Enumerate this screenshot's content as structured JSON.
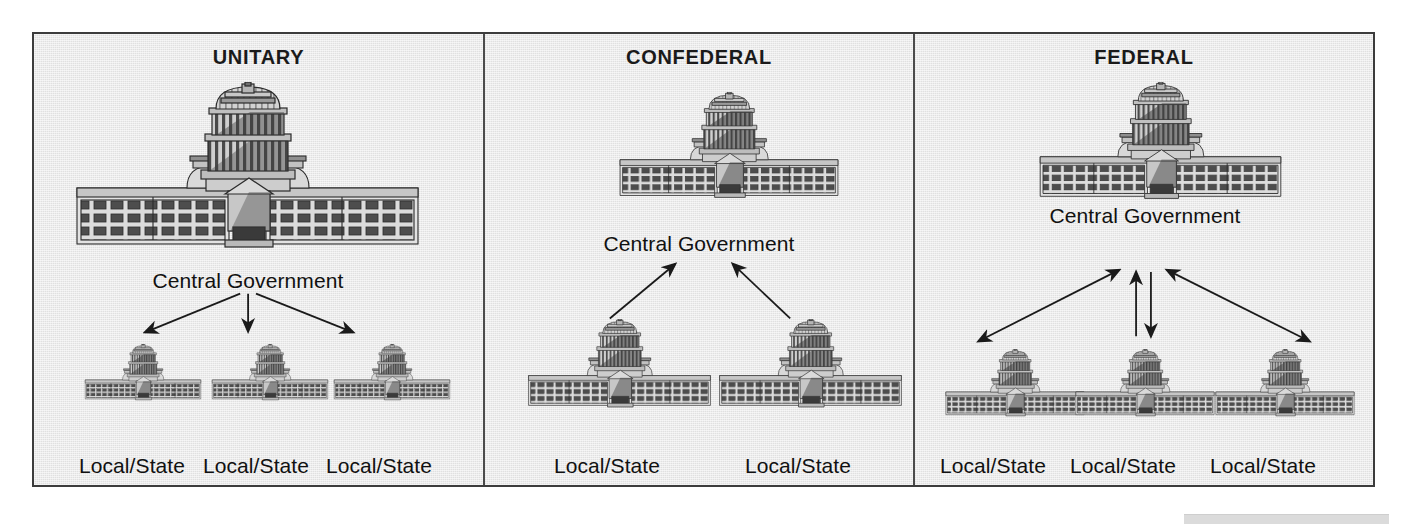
{
  "figure": {
    "background_color": "#e9e9e9",
    "frame_border_color": "#3c3c3c",
    "ink_color": "#1a1a1a"
  },
  "panels": [
    {
      "id": "unitary",
      "title": "UNITARY",
      "central_label": "Central Government",
      "flow": "top-down",
      "arrow_description": "three arrows from central government down to each local/state",
      "children": [
        {
          "label": "Local/State"
        },
        {
          "label": "Local/State"
        },
        {
          "label": "Local/State"
        }
      ]
    },
    {
      "id": "confederal",
      "title": "CONFEDERAL",
      "central_label": "Central Government",
      "flow": "bottom-up",
      "arrow_description": "two arrows from local/state up to central government",
      "children": [
        {
          "label": "Local/State"
        },
        {
          "label": "Local/State"
        }
      ]
    },
    {
      "id": "federal",
      "title": "FEDERAL",
      "central_label": "Central Government",
      "flow": "bidirectional",
      "arrow_description": "double-headed arrows between central government and each local/state",
      "children": [
        {
          "label": "Local/State"
        },
        {
          "label": "Local/State"
        },
        {
          "label": "Local/State"
        }
      ]
    }
  ],
  "chart_data": {
    "type": "diagram",
    "title": "",
    "diagram_kind": "government-systems-comparison",
    "nodes": [
      {
        "panel": "UNITARY",
        "role": "central",
        "label": "Central Government"
      },
      {
        "panel": "UNITARY",
        "role": "local",
        "label": "Local/State"
      },
      {
        "panel": "UNITARY",
        "role": "local",
        "label": "Local/State"
      },
      {
        "panel": "UNITARY",
        "role": "local",
        "label": "Local/State"
      },
      {
        "panel": "CONFEDERAL",
        "role": "central",
        "label": "Central Government"
      },
      {
        "panel": "CONFEDERAL",
        "role": "local",
        "label": "Local/State"
      },
      {
        "panel": "CONFEDERAL",
        "role": "local",
        "label": "Local/State"
      },
      {
        "panel": "FEDERAL",
        "role": "central",
        "label": "Central Government"
      },
      {
        "panel": "FEDERAL",
        "role": "local",
        "label": "Local/State"
      },
      {
        "panel": "FEDERAL",
        "role": "local",
        "label": "Local/State"
      },
      {
        "panel": "FEDERAL",
        "role": "local",
        "label": "Local/State"
      }
    ],
    "edges": [
      {
        "panel": "UNITARY",
        "from": "Central Government",
        "to": "Local/State",
        "direction": "down"
      },
      {
        "panel": "UNITARY",
        "from": "Central Government",
        "to": "Local/State",
        "direction": "down"
      },
      {
        "panel": "UNITARY",
        "from": "Central Government",
        "to": "Local/State",
        "direction": "down"
      },
      {
        "panel": "CONFEDERAL",
        "from": "Local/State",
        "to": "Central Government",
        "direction": "up"
      },
      {
        "panel": "CONFEDERAL",
        "from": "Local/State",
        "to": "Central Government",
        "direction": "up"
      },
      {
        "panel": "FEDERAL",
        "from": "Central Government",
        "to": "Local/State",
        "direction": "both"
      },
      {
        "panel": "FEDERAL",
        "from": "Central Government",
        "to": "Local/State",
        "direction": "both"
      },
      {
        "panel": "FEDERAL",
        "from": "Central Government",
        "to": "Local/State",
        "direction": "both"
      }
    ]
  }
}
